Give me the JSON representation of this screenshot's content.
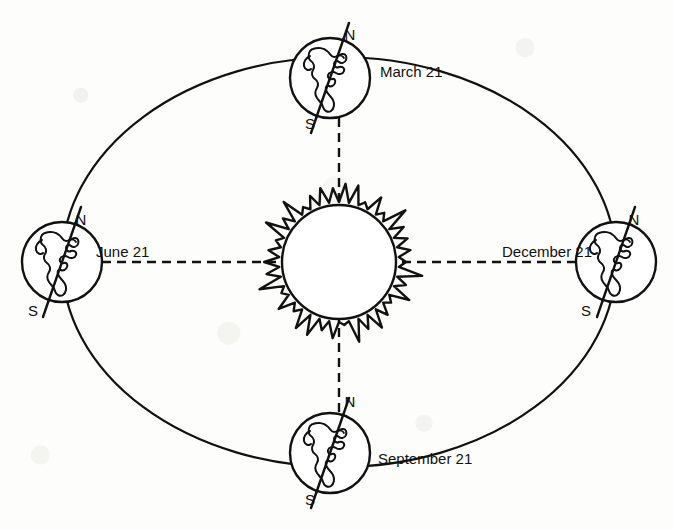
{
  "figure": {
    "kind": "earth-orbit-seasons-diagram",
    "background_color": "#fdfdfb",
    "ink_color": "#111111"
  },
  "sun": {
    "label": "Sun",
    "center": {
      "x": 339,
      "y": 262
    },
    "core_radius": 57,
    "corona_outer_radius": 74,
    "corona_spikes": 38
  },
  "orbit": {
    "shape": "ellipse",
    "center": {
      "x": 339,
      "y": 262
    },
    "radius_x": 277,
    "radius_y": 205,
    "stroke_width": 2.2
  },
  "axis_lines": {
    "style": "dashed",
    "dash": "9 6",
    "stroke_width": 2.4,
    "horizontal_label": "equinox-solstice-axis-horizontal",
    "vertical_label": "equinox-solstice-axis-vertical"
  },
  "pole_labels": {
    "north": "N",
    "south": "S"
  },
  "positions": [
    {
      "id": "march",
      "label": "March 21",
      "season_event": "Vernal equinox",
      "orbit_angle_deg": 90,
      "globe_center": {
        "x": 330,
        "y": 78
      },
      "globe_radius": 40,
      "label_x": 380,
      "label_y": 77,
      "label_anchor": "start",
      "north_label_pos": {
        "x": 350,
        "y": 40
      },
      "south_label_pos": {
        "x": 310,
        "y": 129
      }
    },
    {
      "id": "june",
      "label": "June 21",
      "season_event": "Summer solstice",
      "orbit_angle_deg": 180,
      "globe_center": {
        "x": 62,
        "y": 262
      },
      "globe_radius": 40,
      "label_x": 96,
      "label_y": 257,
      "label_anchor": "start",
      "north_label_pos": {
        "x": 81,
        "y": 225
      },
      "south_label_pos": {
        "x": 33,
        "y": 316
      }
    },
    {
      "id": "december",
      "label": "December 21",
      "season_event": "Winter solstice",
      "orbit_angle_deg": 0,
      "globe_center": {
        "x": 616,
        "y": 262
      },
      "globe_radius": 40,
      "label_x": 592,
      "label_y": 257,
      "label_anchor": "end",
      "north_label_pos": {
        "x": 634,
        "y": 225
      },
      "south_label_pos": {
        "x": 586,
        "y": 316
      }
    },
    {
      "id": "september",
      "label": "September 21",
      "season_event": "Autumnal equinox",
      "orbit_angle_deg": 270,
      "globe_center": {
        "x": 330,
        "y": 453
      },
      "globe_radius": 40,
      "label_x": 378,
      "label_y": 464,
      "label_anchor": "start",
      "north_label_pos": {
        "x": 350,
        "y": 407
      },
      "south_label_pos": {
        "x": 310,
        "y": 505
      }
    }
  ]
}
